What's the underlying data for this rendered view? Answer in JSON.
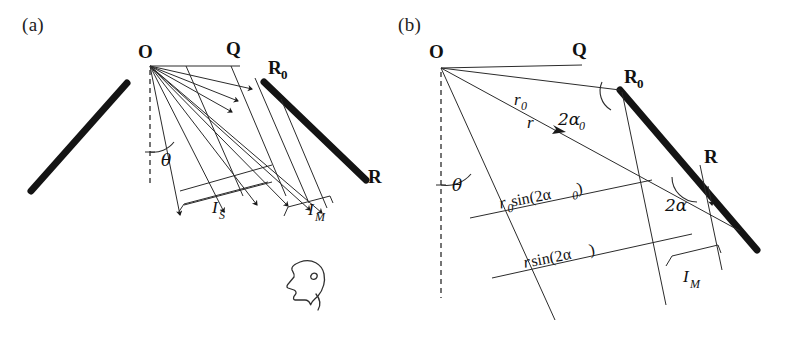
{
  "figure": {
    "type": "optics-ray-diagram",
    "background": "#ffffff",
    "ink_color": "#141414",
    "panels": [
      {
        "id": "a",
        "label": "(a)",
        "points": [
          {
            "name": "O",
            "label": "O",
            "sub": "",
            "x": 150,
            "y": 62
          },
          {
            "name": "Q",
            "label": "Q",
            "sub": "",
            "x": 232,
            "y": 62
          },
          {
            "name": "R0",
            "label": "R",
            "sub": "0",
            "x": 266,
            "y": 83
          },
          {
            "name": "R",
            "label": "R",
            "sub": "",
            "x": 363,
            "y": 176
          }
        ],
        "annotations": [
          {
            "name": "theta",
            "label": "θ"
          },
          {
            "name": "I_S",
            "label": "I",
            "sub": "S"
          },
          {
            "name": "I_M",
            "label": "I",
            "sub": "M"
          }
        ],
        "objects": [
          {
            "name": "source-mirror-bar",
            "kind": "thick-line"
          },
          {
            "name": "image-mirror-bar",
            "kind": "thick-line"
          },
          {
            "name": "vertical-normal",
            "kind": "dashed-line"
          },
          {
            "name": "observer-head",
            "kind": "profile-icon"
          }
        ]
      },
      {
        "id": "b",
        "label": "(b)",
        "points": [
          {
            "name": "O",
            "label": "O",
            "sub": "",
            "x": 441,
            "y": 65
          },
          {
            "name": "Q",
            "label": "Q",
            "sub": "",
            "x": 578,
            "y": 58
          },
          {
            "name": "R0",
            "label": "R",
            "sub": "0",
            "x": 622,
            "y": 92
          },
          {
            "name": "R",
            "label": "R",
            "sub": "",
            "x": 700,
            "y": 165
          }
        ],
        "annotations": [
          {
            "name": "r0",
            "label": "r",
            "sub": "0"
          },
          {
            "name": "r",
            "label": "r",
            "sub": ""
          },
          {
            "name": "two-alpha-zero",
            "label": "2α",
            "sub": "0"
          },
          {
            "name": "two-alpha",
            "label": "2α",
            "sub": ""
          },
          {
            "name": "theta",
            "label": "θ"
          },
          {
            "name": "r0-sin-2alpha0",
            "label": "r",
            "sub": "0",
            "fn": "sin(2α",
            "fn_sub": "0",
            "fn_tail": ")"
          },
          {
            "name": "r-sin-2alpha",
            "label": "r",
            "sub": "",
            "fn": "sin(2α",
            "fn_sub": "",
            "fn_tail": ")"
          },
          {
            "name": "I_M",
            "label": "I",
            "sub": "M"
          }
        ],
        "objects": [
          {
            "name": "image-mirror-bar",
            "kind": "thick-line"
          },
          {
            "name": "vertical-normal",
            "kind": "dashed-line"
          }
        ]
      }
    ]
  }
}
